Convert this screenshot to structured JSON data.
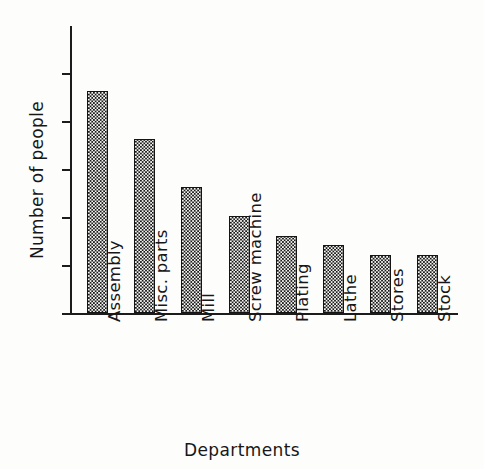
{
  "chart_data": {
    "type": "bar",
    "title": "",
    "xlabel": "Departments",
    "ylabel": "Number of people",
    "categories": [
      "Assembly",
      "Misc. parts",
      "Mill",
      "Screw machine",
      "Plating",
      "Lathe",
      "Stores",
      "Stock"
    ],
    "values": [
      23,
      18,
      13,
      10,
      8,
      7,
      6,
      6
    ],
    "ylim": [
      0,
      28
    ],
    "yticks": [
      0,
      5,
      10,
      15,
      20,
      25
    ],
    "ytick_labels": [
      "0",
      "5",
      "10",
      "15",
      "20",
      "25"
    ],
    "grid": false,
    "legend": false,
    "bar_fill": "#e8e8e6",
    "bar_edge": "#141414",
    "axis_color": "#1c1c1c",
    "background": "#fdfdfc"
  }
}
